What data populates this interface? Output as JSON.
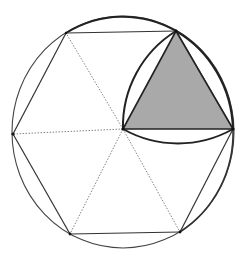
{
  "diagram": {
    "colors": {
      "background": "#ffffff",
      "stroke": "#2a2a2a",
      "thin_stroke": "#555555",
      "dotted_stroke": "#777777",
      "fill": "#a9a9a9"
    },
    "circle": {
      "cx": 123,
      "cy": 132,
      "rx": 111,
      "ry": 116
    },
    "center": {
      "x": 123,
      "y": 129
    },
    "hexagon_vertices": [
      {
        "x": 66,
        "y": 33
      },
      {
        "x": 176,
        "y": 31
      },
      {
        "x": 233,
        "y": 129
      },
      {
        "x": 180,
        "y": 232
      },
      {
        "x": 70,
        "y": 234
      },
      {
        "x": 13,
        "y": 134
      }
    ],
    "shaded_triangle": [
      {
        "x": 123,
        "y": 129
      },
      {
        "x": 176,
        "y": 31
      },
      {
        "x": 233,
        "y": 129
      }
    ]
  }
}
